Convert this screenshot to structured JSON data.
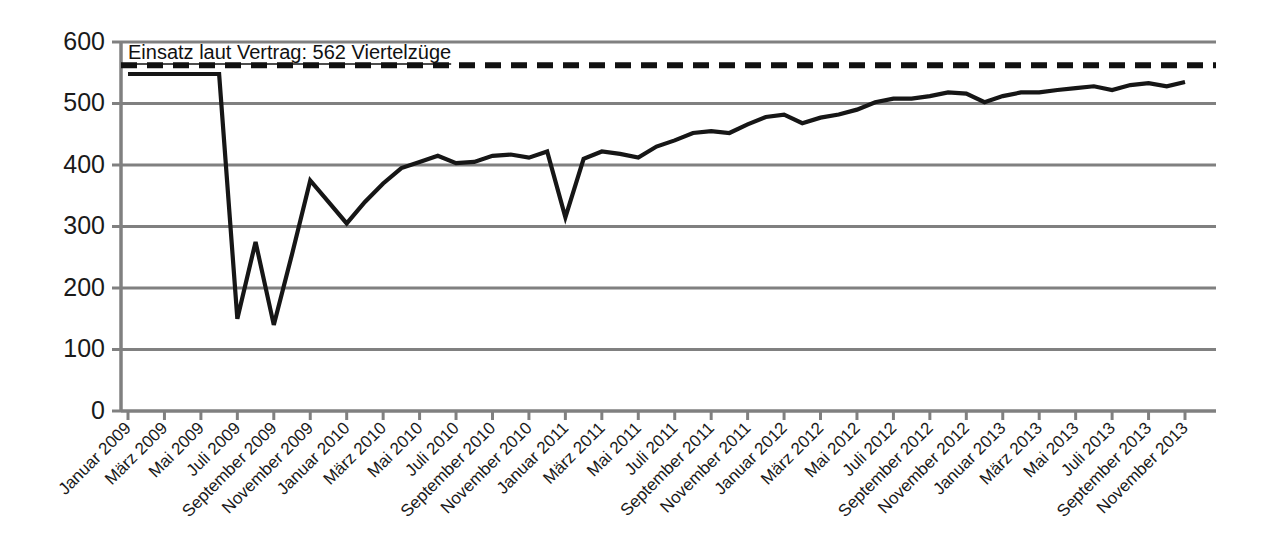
{
  "chart_data": {
    "type": "line",
    "title": "",
    "xlabel": "",
    "ylabel": "",
    "ylim": [
      0,
      600
    ],
    "yticks": [
      0,
      100,
      200,
      300,
      400,
      500,
      600
    ],
    "grid": true,
    "legend_position": "none",
    "annotations": [
      {
        "name": "contract-target",
        "text": "Einsatz laut Vertrag: 562 Viertelzüge",
        "value": 562,
        "style": "dashed-horizontal-line"
      }
    ],
    "x": [
      "Januar 2009",
      "Februar 2009",
      "März 2009",
      "April 2009",
      "Mai 2009",
      "Juni 2009",
      "Juli 2009",
      "August 2009",
      "September 2009",
      "Oktober 2009",
      "November 2009",
      "Dezember 2009",
      "Januar 2010",
      "Februar 2010",
      "März 2010",
      "April 2010",
      "Mai 2010",
      "Juni 2010",
      "Juli 2010",
      "August 2010",
      "September 2010",
      "Oktober 2010",
      "November 2010",
      "Dezember 2010",
      "Januar 2011",
      "Februar 2011",
      "März 2011",
      "April 2011",
      "Mai 2011",
      "Juni 2011",
      "Juli 2011",
      "August 2011",
      "September 2011",
      "Oktober 2011",
      "November 2011",
      "Dezember 2011",
      "Januar 2012",
      "Februar 2012",
      "März 2012",
      "April 2012",
      "Mai 2012",
      "Juni 2012",
      "Juli 2012",
      "August 2012",
      "September 2012",
      "Oktober 2012",
      "November 2012",
      "Dezember 2012",
      "Januar 2013",
      "Februar 2013",
      "März 2013",
      "April 2013",
      "Mai 2013",
      "Juni 2013",
      "Juli 2013",
      "August 2013",
      "September 2013",
      "Oktober 2013",
      "November 2013"
    ],
    "xtick_labels": [
      "Januar 2009",
      "März 2009",
      "Mai 2009",
      "Juli 2009",
      "September 2009",
      "November 2009",
      "Januar 2010",
      "März 2010",
      "Mai 2010",
      "Juli 2010",
      "September 2010",
      "November 2010",
      "Januar 2011",
      "März 2011",
      "Mai 2011",
      "Juli 2011",
      "September 2011",
      "November 2011",
      "Januar 2012",
      "März 2012",
      "Mai 2012",
      "Juli 2012",
      "September 2012",
      "November 2012",
      "Januar 2013",
      "März 2013",
      "Mai 2013",
      "Juli 2013",
      "September 2013",
      "November 2013"
    ],
    "series": [
      {
        "name": "Viertelzüge",
        "values": [
          548,
          548,
          548,
          548,
          548,
          548,
          150,
          275,
          140,
          255,
          375,
          340,
          305,
          340,
          370,
          395,
          405,
          415,
          403,
          405,
          415,
          417,
          412,
          422,
          315,
          410,
          422,
          418,
          412,
          430,
          440,
          452,
          455,
          452,
          466,
          478,
          482,
          468,
          477,
          482,
          490,
          502,
          508,
          508,
          512,
          518,
          516,
          502,
          512,
          518,
          518,
          522,
          525,
          528,
          522,
          530,
          533,
          528,
          535
        ]
      }
    ]
  },
  "axis": {
    "y_tick_text": [
      "600",
      "500",
      "400",
      "300",
      "200",
      "100",
      "0"
    ]
  }
}
